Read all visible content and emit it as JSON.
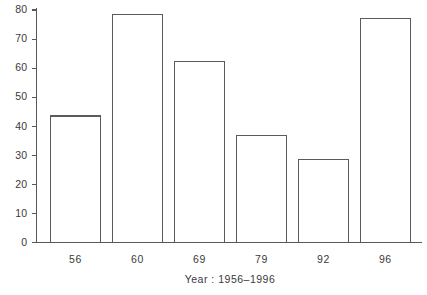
{
  "chart_data": {
    "type": "bar",
    "title": "",
    "subtitle": "",
    "xlabel": "Year :   1956–1996",
    "ylabel": "",
    "categories": [
      "56",
      "60",
      "69",
      "79",
      "92",
      "96"
    ],
    "values": [
      43.5,
      78.5,
      62.3,
      36.7,
      28.5,
      77.0
    ],
    "series": [
      {
        "name": "",
        "values": [
          43.5,
          78.5,
          62.3,
          36.7,
          28.5,
          77.0
        ]
      }
    ],
    "ylim": [
      0,
      80
    ],
    "xlim_note": "categorical",
    "ytick_labels": [
      "0",
      "10",
      "20",
      "30",
      "40",
      "50",
      "60",
      "70",
      "80"
    ],
    "ytick_values": [
      0,
      10,
      20,
      30,
      40,
      50,
      60,
      70,
      80
    ],
    "grid": false,
    "legend": null,
    "legend_position": "none",
    "annotations": [],
    "bar_fill_color": "#ffffff",
    "bar_edge_color": "#5a5a5a",
    "axis_color": "#585858",
    "text_color": "#3a3a3a",
    "background_color": "#ffffff"
  },
  "axes": {
    "y_axis_name": "value-axis",
    "x_axis_name": "year-axis"
  }
}
